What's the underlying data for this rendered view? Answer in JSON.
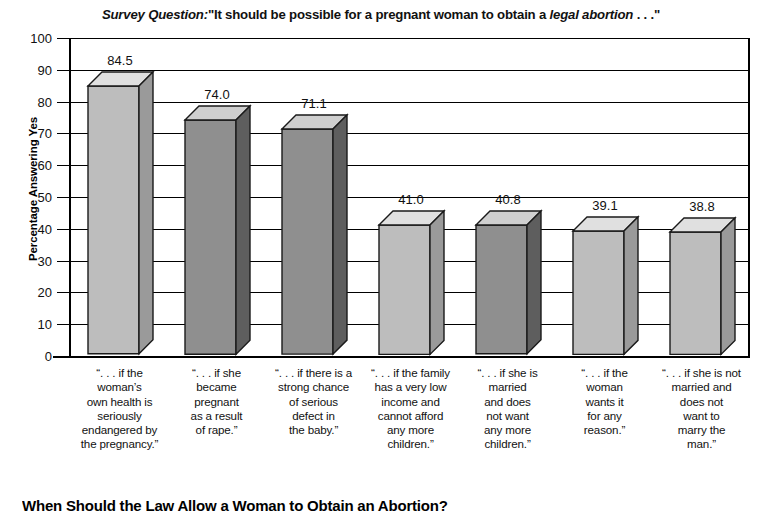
{
  "chart_data": {
    "type": "bar",
    "title_parts": {
      "label_italic": "Survey Question:",
      "quote_open": "\"It should be possible for a pregnant woman to obtain a ",
      "emphasis": "legal abortion",
      "quote_close": " . . .\""
    },
    "xlabel": "",
    "ylabel": "Percentage Answering Yes",
    "ylim": [
      0,
      100
    ],
    "ytick_step": 10,
    "yticks": [
      100,
      90,
      80,
      70,
      60,
      50,
      40,
      30,
      20,
      10,
      0
    ],
    "grid": true,
    "legend": false,
    "categories": [
      "“. . . if the woman’s own health is seriously endangered by the pregnancy.”",
      "“. . . if she became pregnant as a result of rape.”",
      "“. . . if there is a strong chance of serious defect in the baby.”",
      "“. . . if the family has a very low income and cannot afford any more children.”",
      "“. . . if she is married and does not want any more children.”",
      "“. . . if the woman wants it for any reason.”",
      "“. . . if she is not married and does not want to marry the man.”"
    ],
    "category_lines": [
      [
        "“. . . if the",
        "woman’s",
        "own health is",
        "seriously",
        "endangered by",
        "the pregnancy.”"
      ],
      [
        "“. . . if she",
        "became",
        "pregnant",
        "as a result",
        "of rape.”"
      ],
      [
        "“. . . if there is a",
        "strong chance",
        "of serious",
        "defect in",
        "the baby.”"
      ],
      [
        "“. . . if the family",
        "has a very low",
        "income and",
        "cannot afford",
        "any more",
        "children.”"
      ],
      [
        "“. . . if she is",
        "married",
        "and does",
        "not want",
        "any more",
        "children.”"
      ],
      [
        "“. . . if the",
        "woman",
        "wants it",
        "for any",
        "reason.”"
      ],
      [
        "“. . . if she is not",
        "married and",
        "does not",
        "want to",
        "marry the",
        "man.”"
      ]
    ],
    "values": [
      84.5,
      74.0,
      71.1,
      41.0,
      40.8,
      39.1,
      38.8
    ],
    "value_labels": [
      "84.5",
      "74.0",
      "71.1",
      "41.0",
      "40.8",
      "39.1",
      "38.8"
    ],
    "bar_shades": [
      "light",
      "dark",
      "dark",
      "light",
      "dark",
      "light",
      "light"
    ]
  },
  "caption": {
    "text": "When Should the Law Allow a Woman to Obtain an Abortion?"
  },
  "colors": {
    "bar_light_front": "#bdbdbd",
    "bar_light_top": "#e0e0e0",
    "bar_light_side": "#9a9a9a",
    "bar_dark_front": "#8f8f8f",
    "bar_dark_top": "#cfcfcf",
    "bar_dark_side": "#5e5e5e",
    "axis": "#000000",
    "text": "#111111",
    "background": "#ffffff"
  }
}
